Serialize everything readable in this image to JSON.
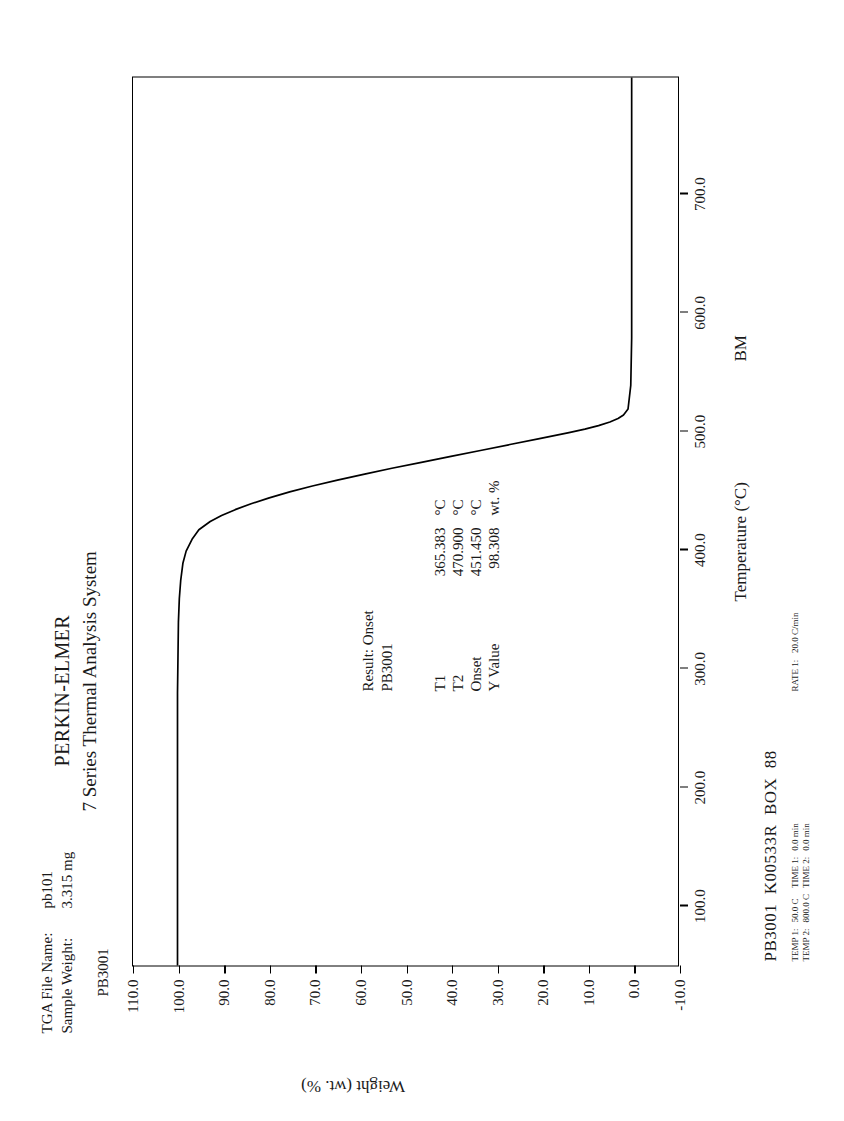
{
  "header": {
    "brand": "PERKIN-ELMER",
    "brand_sub": "7 Series Thermal Analysis System",
    "file_label": "TGA File Name:",
    "file_value": "pb101",
    "weight_label": "Sample Weight:",
    "weight_value": "3.315 mg",
    "sample_id": "PB3001"
  },
  "results": {
    "title": "Result:  Onset",
    "sample": "PB3001",
    "rows": [
      {
        "name": "T1",
        "value": "365.383",
        "unit": "°C"
      },
      {
        "name": "T2",
        "value": "470.900",
        "unit": "°C"
      },
      {
        "name": "Onset",
        "value": "451.450",
        "unit": "°C"
      },
      {
        "name": "Y Value",
        "value": "98.308",
        "unit": "wt. %"
      }
    ]
  },
  "footer": {
    "main": "PB3001  K00533R  BOX  88",
    "operator": "BM",
    "meta": [
      {
        "label": "TEMP 1:",
        "value": "50.0 C",
        "time_label": "TIME 1:",
        "time_value": "0.0 min"
      },
      {
        "label": "TEMP 2:",
        "value": "800.0 C",
        "time_label": "TIME 2:",
        "time_value": "0.0 min"
      }
    ],
    "rate_label": "RATE 1:",
    "rate_value": "20.0 C/min"
  },
  "chart_data": {
    "type": "line",
    "xlabel": "Temperature (°C)",
    "ylabel": "Weight (wt. %)",
    "xlim": [
      50.0,
      800.0
    ],
    "ylim": [
      -10.0,
      110.0
    ],
    "xticks": [
      "100.0",
      "200.0",
      "300.0",
      "400.0",
      "500.0",
      "600.0",
      "700.0"
    ],
    "xtick_values": [
      100,
      200,
      300,
      400,
      500,
      600,
      700
    ],
    "yticks": [
      "110.0",
      "100.0",
      "90.0",
      "80.0",
      "70.0",
      "60.0",
      "50.0",
      "40.0",
      "30.0",
      "20.0",
      "10.0",
      "0.0",
      "-10.0"
    ],
    "ytick_values": [
      110,
      100,
      90,
      80,
      70,
      60,
      50,
      40,
      30,
      20,
      10,
      0,
      -10
    ],
    "grid": false,
    "legend": "none",
    "series": [
      {
        "name": "PB3001 weight loss",
        "x": [
          50,
          80,
          120,
          160,
          200,
          240,
          280,
          310,
          340,
          360,
          375,
          390,
          400,
          410,
          418,
          425,
          430,
          435,
          440,
          445,
          450,
          455,
          460,
          465,
          470,
          475,
          480,
          485,
          490,
          495,
          500,
          503,
          506,
          509,
          512,
          515,
          520,
          540,
          580,
          640,
          700,
          760,
          800
        ],
        "y": [
          100.2,
          100.2,
          100.2,
          100.2,
          100.2,
          100.2,
          100.2,
          100.1,
          100.0,
          99.8,
          99.5,
          99.0,
          98.3,
          97.0,
          95.5,
          93.0,
          90.5,
          87.5,
          84.0,
          80.0,
          75.5,
          70.5,
          65.0,
          59.0,
          53.0,
          46.5,
          40.0,
          33.5,
          27.0,
          20.5,
          14.0,
          10.5,
          7.5,
          5.0,
          3.2,
          2.0,
          1.0,
          0.4,
          0.2,
          0.2,
          0.2,
          0.2,
          0.2
        ]
      }
    ],
    "annotations": [
      {
        "label": "T1",
        "value": 365.383,
        "unit": "°C"
      },
      {
        "label": "T2",
        "value": 470.9,
        "unit": "°C"
      },
      {
        "label": "Onset",
        "value": 451.45,
        "unit": "°C"
      },
      {
        "label": "Y Value",
        "value": 98.308,
        "unit": "wt. %"
      }
    ]
  }
}
